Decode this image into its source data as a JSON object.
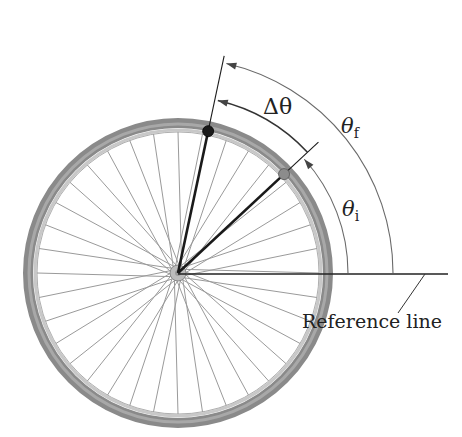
{
  "figure": {
    "labels": {
      "delta_theta": "Δθ",
      "theta_f": "θ",
      "theta_f_sub": "f",
      "theta_i": "θ",
      "theta_i_sub": "i",
      "reference_line": "Reference line"
    },
    "wheel": {
      "center": [
        178,
        273
      ],
      "outer_radius": 155,
      "spoke_count": 36
    },
    "angles_deg": {
      "initial": 43,
      "final": 78
    },
    "arcs": {
      "theta_i_radius": 170,
      "delta_theta_radius": 177,
      "theta_f_radius": 215
    },
    "colors": {
      "rim": "#8a8a8a",
      "rim_light": "#c8c8c8",
      "spoke": "#9a9a9a",
      "line": "#1a1a1a",
      "arc": "#6a6a6a",
      "dot_final": "#1a1a1a",
      "dot_initial": "#8c8c8c"
    }
  }
}
